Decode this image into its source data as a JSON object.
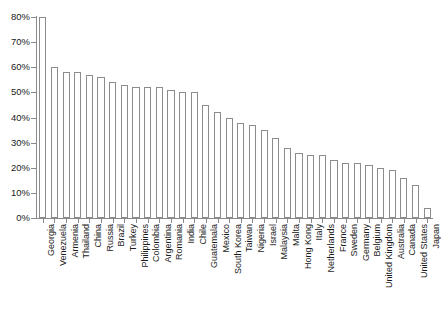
{
  "chart_data": {
    "type": "bar",
    "title": "",
    "subtitle": "",
    "xlabel": "",
    "ylabel": "",
    "ylim": [
      0,
      80
    ],
    "grid": false,
    "legend": false,
    "y_tick_labels": [
      "80%",
      "70%",
      "60%",
      "50%",
      "40%",
      "30%",
      "20%",
      "10%",
      "0%"
    ],
    "y_tick_values": [
      80,
      70,
      60,
      50,
      40,
      30,
      20,
      10,
      0
    ],
    "value_suffix": "%",
    "bar_fill_color": "#ffffff",
    "bar_edge_color": "#8c8c8c",
    "axis_color": "#8a8a8a",
    "text_color": "#1a1a1a",
    "background_color": "#ffffff",
    "categories": [
      "Georgia",
      "Venezuela",
      "Armenia",
      "Thailand",
      "China",
      "Russia",
      "Brazil",
      "Turkey",
      "Philippines",
      "Colombia",
      "Argentina",
      "Romania",
      "India",
      "Chile",
      "Guatemala",
      "Mexico",
      "South Korea",
      "Taiwan",
      "Nigeria",
      "Israel",
      "Malaysia",
      "Malta",
      "Hong Kong",
      "Italy",
      "Netherlands",
      "France",
      "Sweden",
      "Germany",
      "Belgium",
      "United Kingdom",
      "Australia",
      "Canada",
      "United States",
      "Japan"
    ],
    "values": [
      80,
      60,
      58,
      58,
      57,
      56,
      54,
      53,
      52,
      52,
      52,
      51,
      50,
      50,
      45,
      42,
      40,
      38,
      37,
      35,
      32,
      28,
      26,
      25,
      25,
      23,
      22,
      22,
      21,
      20,
      19,
      16,
      13,
      4
    ]
  }
}
